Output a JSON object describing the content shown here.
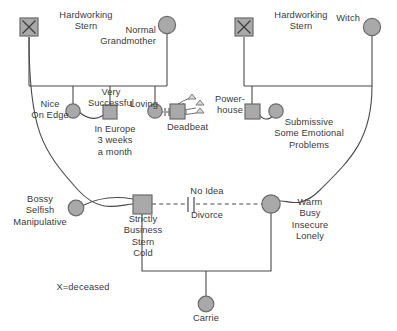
{
  "diagram": {
    "legend": "X=deceased",
    "colors": {
      "node_fill": "#a9a9a9",
      "node_stroke": "#6b6b6b",
      "line": "#4a4a4a",
      "text": "#3a3a3a"
    }
  },
  "nodes": {
    "paternal_grandfather": {
      "label": "Hardworking\nStern",
      "shape": "square",
      "deceased": true,
      "deceased_mark": "X"
    },
    "paternal_grandmother": {
      "label": "Normal\nGrandmother",
      "shape": "circle",
      "deceased": false
    },
    "maternal_grandfather": {
      "label": "Hardworking\nStern",
      "shape": "square",
      "deceased": true,
      "deceased_mark": "X"
    },
    "maternal_grandmother": {
      "label": "Witch",
      "shape": "circle",
      "deceased": false
    },
    "aunt_nice": {
      "label": "Nice\nOn Edge",
      "shape": "circle",
      "deceased": false
    },
    "uncle_very_successful": {
      "label": "Very\nSuccessful",
      "shape": "square",
      "deceased": false,
      "note": "In Europe\n3 weeks\na month"
    },
    "aunt_loving": {
      "label": "Loving",
      "shape": "circle",
      "deceased": false
    },
    "uncle_deadbeat": {
      "label": "Deadbeat",
      "shape": "square",
      "deceased": false
    },
    "uncle_powerhouse": {
      "label": "Power-\nhouse",
      "shape": "square",
      "deceased": false
    },
    "aunt_submissive": {
      "label": "Submissive\nSome Emotional\nProblems",
      "shape": "circle",
      "deceased": false
    },
    "father_prev_partner": {
      "label": "Bossy\nSelfish\nManipulative",
      "shape": "circle",
      "deceased": false
    },
    "father": {
      "label": "Strictly\nBusiness\nStern\nCold",
      "shape": "square",
      "deceased": false
    },
    "mother": {
      "label": "Warm\nBusy\nInsecure\nLonely",
      "shape": "circle",
      "deceased": false
    },
    "child": {
      "label": "Carrie",
      "shape": "circle",
      "deceased": false
    }
  },
  "relationships": {
    "divorce": {
      "top_label": "No Idea",
      "bottom_label": "Divorce",
      "style": "dashed-with-double-slash"
    }
  }
}
